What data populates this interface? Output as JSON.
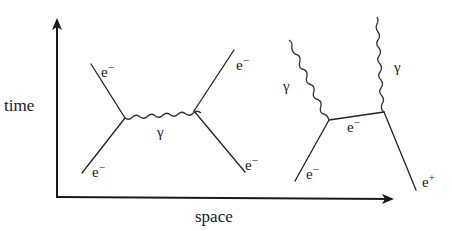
{
  "axes": {
    "y_label": "time",
    "x_label": "space"
  },
  "diagram_left": {
    "title": "electron-electron scattering",
    "incoming_bottom_label": "e−",
    "outgoing_top_left_label": "e−",
    "outgoing_top_right_label": "e−",
    "incoming_bottom_right_label": "e−",
    "exchange_label": "γ"
  },
  "diagram_right": {
    "title": "pair annihilation into photons",
    "photon_left_label": "γ",
    "photon_right_label": "γ",
    "propagator_label": "e−",
    "electron_in_label": "e−",
    "positron_in_label": "e+"
  },
  "colors": {
    "ink": "#1a1a1a",
    "background": "#ffffff"
  }
}
